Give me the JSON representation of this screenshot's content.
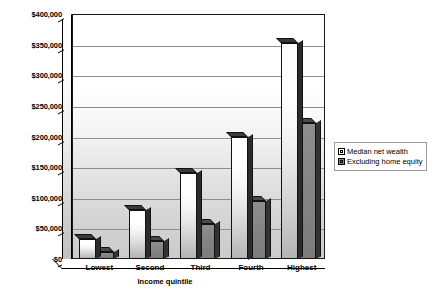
{
  "chart_data": {
    "type": "bar",
    "title": "",
    "xlabel": "Income quintile",
    "ylabel": "",
    "categories": [
      "Lowest",
      "Second",
      "Third",
      "Fourth",
      "Highest"
    ],
    "series": [
      {
        "name": "Median net wealth",
        "values": [
          32000,
          80000,
          140000,
          200000,
          352000
        ]
      },
      {
        "name": "Excluding home equity",
        "values": [
          12000,
          30000,
          57000,
          95000,
          222000
        ]
      }
    ],
    "ylim": [
      0,
      400000
    ],
    "ytick_values": [
      0,
      50000,
      100000,
      150000,
      200000,
      250000,
      300000,
      350000,
      400000
    ],
    "ytick_labels": [
      "$0",
      "$50,000",
      "$100,000",
      "$150,000",
      "$200,000",
      "$250,000",
      "$300,000",
      "$350,000",
      "$400,000"
    ],
    "grid": true,
    "legend_position": "right",
    "style_3d": true,
    "colors": {
      "series_1_fill": "#ffffff",
      "series_1_shade": "#b4b4b4",
      "series_2_fill": "#8a8a8a",
      "series_2_shade": "#7c7c7c",
      "plot_background": "#f0f0f0",
      "gridline": "#8f8f8f",
      "axis": "#000000",
      "text": "#000000"
    }
  },
  "legend": {
    "items": [
      {
        "label": "Median net wealth"
      },
      {
        "label": "Excluding home equity"
      }
    ]
  }
}
